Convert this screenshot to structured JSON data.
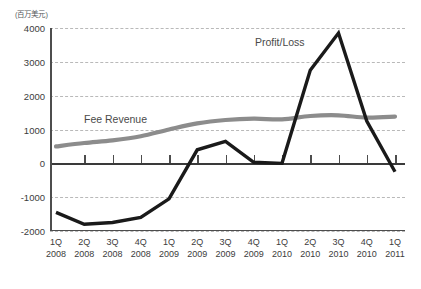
{
  "axis_unit_caption": "(百万美元)",
  "series_labels": {
    "fee_revenue": "Fee Revenue",
    "profit_loss": "Profit/Loss"
  },
  "colors": {
    "fee_revenue": "#8c8c8c",
    "profit_loss": "#1a1a1a",
    "gridline": "#b9b9b9",
    "axis": "#4d4d4d",
    "text": "#3c3c3c"
  },
  "chart_data": {
    "type": "line",
    "title": "",
    "subtitle": "",
    "xlabel": "",
    "ylabel": "(百万美元)",
    "ylim": [
      -2000,
      4000
    ],
    "yticks": [
      -2000,
      -1000,
      0,
      1000,
      2000,
      3000,
      4000
    ],
    "ytick_labels": [
      "-2000",
      "-1000",
      "0",
      "1000",
      "2000",
      "3000",
      "4000"
    ],
    "grid": true,
    "grid_style": "dashed-horizontal",
    "legend": "inline-annotation",
    "categories": [
      "1Q 2008",
      "2Q 2008",
      "3Q 2008",
      "4Q 2008",
      "1Q 2009",
      "2Q 2009",
      "3Q 2009",
      "4Q 2009",
      "1Q 2010",
      "2Q 2010",
      "3Q 2010",
      "4Q 2010",
      "1Q 2011"
    ],
    "category_quarters": [
      "1Q",
      "2Q",
      "3Q",
      "4Q",
      "1Q",
      "2Q",
      "3Q",
      "4Q",
      "1Q",
      "2Q",
      "3Q",
      "4Q",
      "1Q"
    ],
    "category_years": [
      "2008",
      "2008",
      "2008",
      "2008",
      "2009",
      "2009",
      "2009",
      "2009",
      "2010",
      "2010",
      "2010",
      "2010",
      "2011"
    ],
    "series": [
      {
        "name": "Fee Revenue",
        "color": "#8c8c8c",
        "values": [
          500,
          600,
          680,
          800,
          1000,
          1180,
          1280,
          1320,
          1300,
          1400,
          1420,
          1350,
          1380
        ]
      },
      {
        "name": "Profit/Loss",
        "color": "#1a1a1a",
        "values": [
          -1450,
          -1800,
          -1750,
          -1600,
          -1050,
          400,
          650,
          30,
          0,
          2750,
          3850,
          1250,
          -250
        ]
      }
    ]
  }
}
